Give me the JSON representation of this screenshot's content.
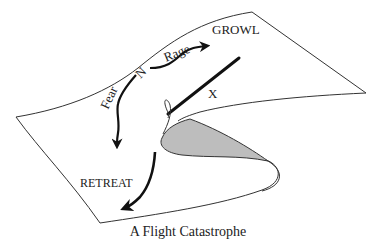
{
  "diagram": {
    "caption": "A Flight Catastrophe",
    "labels": {
      "growl": "GROWL",
      "rage": "Rage",
      "n": "N",
      "fear": "Fear",
      "x": "X",
      "retreat": "RETREAT"
    },
    "colors": {
      "surface_stroke": "#333333",
      "arrow": "#111111",
      "fold_fill": "#bdbdbd",
      "text": "#222222"
    }
  }
}
